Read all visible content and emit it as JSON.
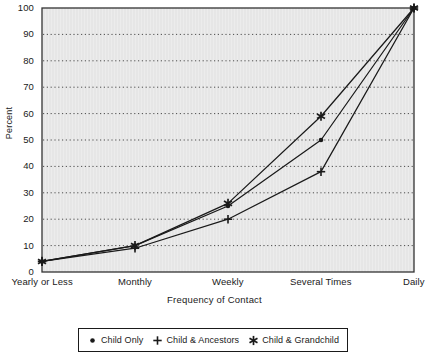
{
  "chart_data": {
    "type": "line",
    "title": "",
    "xlabel": "Frequency of Contact",
    "ylabel": "Percent",
    "categories": [
      "Yearly or Less",
      "Monthly",
      "Weekly",
      "Several Times",
      "Daily"
    ],
    "ylim": [
      0,
      100
    ],
    "yticks": [
      0,
      10,
      20,
      30,
      40,
      50,
      60,
      70,
      80,
      90,
      100
    ],
    "grid": "horizontal-dotted",
    "legend_position": "bottom",
    "series": [
      {
        "name": "Child Only",
        "marker": "dot",
        "values": [
          4,
          10,
          25,
          50,
          100
        ]
      },
      {
        "name": "Child & Ancestors",
        "marker": "plus",
        "values": [
          4,
          9,
          20,
          38,
          100
        ]
      },
      {
        "name": "Child & Grandchild",
        "marker": "asterisk",
        "values": [
          4,
          10,
          26,
          59,
          100
        ]
      }
    ]
  },
  "colors": {
    "line": "#1a1a1a",
    "plot_background": "#ececec",
    "grid": "#4d4d4d",
    "frame": "#333333",
    "text": "#1a1a1a"
  }
}
